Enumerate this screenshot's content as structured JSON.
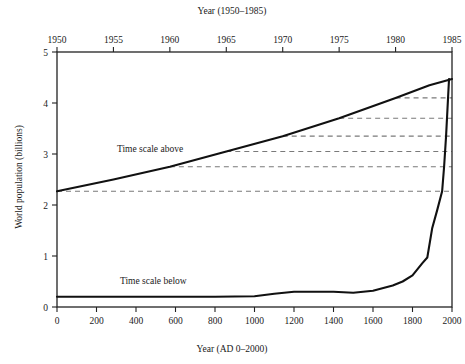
{
  "chart_data": {
    "type": "line",
    "title": "",
    "top_axis": {
      "label": "Year (1950–1985)",
      "ticks": [
        1950,
        1955,
        1960,
        1965,
        1970,
        1975,
        1980,
        1985
      ],
      "tick_labels": [
        "1950",
        "1955",
        "1960",
        "1965",
        "1970",
        "1975",
        "1980",
        "1985"
      ],
      "range": [
        1950,
        1985
      ]
    },
    "bottom_axis": {
      "label": "Year (AD 0–2000)",
      "ticks": [
        0,
        200,
        400,
        600,
        800,
        1000,
        1200,
        1400,
        1600,
        1800,
        2000
      ],
      "tick_labels": [
        "0",
        "200",
        "400",
        "600",
        "800",
        "1000",
        "1200",
        "1400",
        "1600",
        "1800",
        "2000"
      ],
      "range": [
        0,
        2000
      ]
    },
    "ylabel": "World population (billions)",
    "yticks": [
      0,
      1,
      2,
      3,
      4,
      5
    ],
    "ytick_labels": [
      "0",
      "1",
      "2",
      "3",
      "4",
      "5"
    ],
    "ylim": [
      0,
      5
    ],
    "grid": false,
    "legend_position": "inline-annotations",
    "series": [
      {
        "name": "Time scale above",
        "annotation": "Time scale above",
        "axis": "top",
        "x": [
          1950,
          1955,
          1960,
          1965,
          1970,
          1975,
          1980,
          1983,
          1985
        ],
        "values": [
          2.27,
          2.5,
          2.75,
          3.05,
          3.35,
          3.7,
          4.1,
          4.35,
          4.47
        ]
      },
      {
        "name": "Time scale below",
        "annotation": "Time scale below",
        "axis": "bottom",
        "x": [
          0,
          200,
          400,
          600,
          800,
          1000,
          1100,
          1200,
          1300,
          1400,
          1500,
          1600,
          1700,
          1750,
          1800,
          1850,
          1875,
          1900,
          1925,
          1950,
          1960,
          1970,
          1980,
          1985
        ],
        "values": [
          0.2,
          0.2,
          0.2,
          0.2,
          0.2,
          0.21,
          0.26,
          0.3,
          0.3,
          0.3,
          0.28,
          0.32,
          0.42,
          0.5,
          0.62,
          0.86,
          0.97,
          1.55,
          1.9,
          2.27,
          2.75,
          3.35,
          4.1,
          4.47
        ]
      }
    ],
    "dashed_connectors": {
      "note": "Horizontal dashed lines from points on the upper curve to the right frame edge",
      "values": [
        2.27,
        2.75,
        3.05,
        3.35,
        3.7,
        4.1
      ]
    }
  },
  "annotations": {
    "above": "Time scale above",
    "below": "Time scale below"
  },
  "colors": {
    "line": "#111111",
    "dash": "#7a7a7a",
    "frame": "#222222",
    "background": "#ffffff"
  }
}
